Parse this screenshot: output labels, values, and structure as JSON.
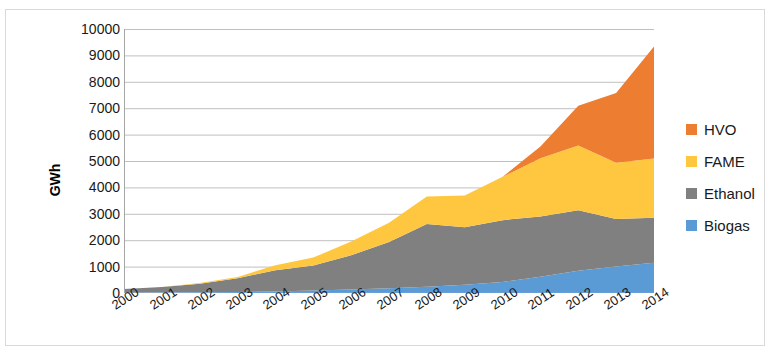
{
  "chart_data": {
    "type": "area",
    "stacked": true,
    "title": "",
    "xlabel": "",
    "ylabel": "GWh",
    "ylim": [
      0,
      10000
    ],
    "ytick_labels": [
      "10000",
      "9000",
      "8000",
      "7000",
      "6000",
      "5000",
      "4000",
      "3000",
      "2000",
      "1000",
      "0"
    ],
    "yticks": [
      10000,
      9000,
      8000,
      7000,
      6000,
      5000,
      4000,
      3000,
      2000,
      1000,
      0
    ],
    "grid": true,
    "legend_position": "right",
    "categories": [
      "2000",
      "2001",
      "2002",
      "2003",
      "2004",
      "2005",
      "2006",
      "2007",
      "2008",
      "2009",
      "2010",
      "2011",
      "2012",
      "2013",
      "2014"
    ],
    "series": [
      {
        "name": "Biogas",
        "color": "#5B9BD5",
        "values": [
          10,
          15,
          25,
          40,
          60,
          90,
          130,
          180,
          240,
          310,
          420,
          620,
          840,
          1000,
          1150
        ]
      },
      {
        "name": "Ethanol",
        "color": "#808080",
        "values": [
          140,
          210,
          330,
          520,
          800,
          950,
          1300,
          1750,
          2370,
          2180,
          2340,
          2280,
          2290,
          1800,
          1700
        ]
      },
      {
        "name": "FAME",
        "color": "#FFC740",
        "values": [
          0,
          0,
          20,
          50,
          190,
          300,
          520,
          730,
          1050,
          1200,
          1640,
          2200,
          2460,
          2130,
          2240
        ]
      },
      {
        "name": "HVO",
        "color": "#ED7D31",
        "values": [
          0,
          0,
          0,
          0,
          0,
          0,
          0,
          0,
          0,
          0,
          0,
          450,
          1500,
          2650,
          4250
        ]
      }
    ],
    "totals": [
      150,
      225,
      375,
      610,
      1050,
      1340,
      1950,
      2660,
      3660,
      3690,
      4400,
      5550,
      7090,
      7580,
      9340
    ]
  },
  "legend": {
    "items": [
      {
        "label": "HVO",
        "color": "#ED7D31"
      },
      {
        "label": "FAME",
        "color": "#FFC740"
      },
      {
        "label": "Ethanol",
        "color": "#808080"
      },
      {
        "label": "Biogas",
        "color": "#5B9BD5"
      }
    ]
  }
}
